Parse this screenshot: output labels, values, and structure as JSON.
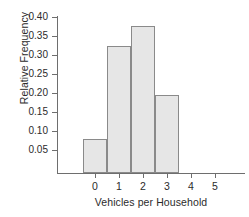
{
  "chart_data": {
    "type": "bar",
    "title": "",
    "subtitle": "",
    "xlabel": "Vehicles per Household",
    "ylabel": "Relative Frequency",
    "categories": [
      "0",
      "1",
      "2",
      "3"
    ],
    "values": [
      0.09,
      0.335,
      0.388,
      0.205
    ],
    "x_tick_labels": [
      "0",
      "1",
      "2",
      "3",
      "4",
      "5"
    ],
    "y_tick_labels": [
      "0.05",
      "0.10",
      "0.15",
      "0.20",
      "0.25",
      "0.30",
      "0.35",
      "0.40"
    ],
    "y_tick_values": [
      0.05,
      0.1,
      0.15,
      0.2,
      0.25,
      0.3,
      0.35,
      0.4
    ],
    "ylim": [
      0.0,
      0.42
    ],
    "xlim": [
      -0.9,
      5.55
    ],
    "grid": false,
    "legend": null,
    "bar_fill_color": "#e6e6e6",
    "bar_edge_color": "#8a8a8a",
    "axis_color": "#6e6e6e",
    "background_color": "#ffffff",
    "text_color": "#2b2b2b"
  },
  "axes": {
    "y_label": "Relative Frequency",
    "x_label": "Vehicles per Household",
    "y_ticks": [
      {
        "label": "0.40",
        "value": 0.4
      },
      {
        "label": "0.35",
        "value": 0.35
      },
      {
        "label": "0.30",
        "value": 0.3
      },
      {
        "label": "0.25",
        "value": 0.25
      },
      {
        "label": "0.20",
        "value": 0.2
      },
      {
        "label": "0.15",
        "value": 0.15
      },
      {
        "label": "0.10",
        "value": 0.1
      },
      {
        "label": "0.05",
        "value": 0.05
      }
    ],
    "x_ticks": [
      {
        "label": "0",
        "value": 0
      },
      {
        "label": "1",
        "value": 1
      },
      {
        "label": "2",
        "value": 2
      },
      {
        "label": "3",
        "value": 3
      },
      {
        "label": "4",
        "value": 4
      },
      {
        "label": "5",
        "value": 5
      }
    ]
  },
  "bars": [
    {
      "category": "0",
      "value": 0.09
    },
    {
      "category": "1",
      "value": 0.335
    },
    {
      "category": "2",
      "value": 0.388
    },
    {
      "category": "3",
      "value": 0.205
    }
  ]
}
